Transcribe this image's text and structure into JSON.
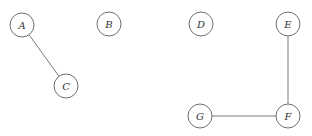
{
  "diagram": {
    "type": "undirected-graph",
    "nodes": [
      {
        "id": "A",
        "label": "A",
        "x": 22,
        "y": 25
      },
      {
        "id": "B",
        "label": "B",
        "x": 109,
        "y": 24
      },
      {
        "id": "C",
        "label": "C",
        "x": 66,
        "y": 86
      },
      {
        "id": "D",
        "label": "D",
        "x": 201,
        "y": 24
      },
      {
        "id": "E",
        "label": "E",
        "x": 288,
        "y": 24
      },
      {
        "id": "F",
        "label": "F",
        "x": 288,
        "y": 116
      },
      {
        "id": "G",
        "label": "G",
        "x": 200,
        "y": 116
      }
    ],
    "edges": [
      {
        "from": "A",
        "to": "C"
      },
      {
        "from": "E",
        "to": "F"
      },
      {
        "from": "G",
        "to": "F"
      }
    ],
    "node_radius": 12
  }
}
